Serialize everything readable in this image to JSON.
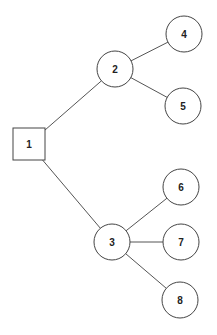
{
  "diagram": {
    "type": "tree",
    "root": "1",
    "nodes": [
      {
        "id": "1",
        "label": "1",
        "shape": "square"
      },
      {
        "id": "2",
        "label": "2",
        "shape": "circle"
      },
      {
        "id": "3",
        "label": "3",
        "shape": "circle"
      },
      {
        "id": "4",
        "label": "4",
        "shape": "circle"
      },
      {
        "id": "5",
        "label": "5",
        "shape": "circle"
      },
      {
        "id": "6",
        "label": "6",
        "shape": "circle"
      },
      {
        "id": "7",
        "label": "7",
        "shape": "circle"
      },
      {
        "id": "8",
        "label": "8",
        "shape": "circle"
      }
    ],
    "edges": [
      {
        "from": "1",
        "to": "2"
      },
      {
        "from": "1",
        "to": "3"
      },
      {
        "from": "2",
        "to": "4"
      },
      {
        "from": "2",
        "to": "5"
      },
      {
        "from": "3",
        "to": "6"
      },
      {
        "from": "3",
        "to": "7"
      },
      {
        "from": "3",
        "to": "8"
      }
    ]
  }
}
